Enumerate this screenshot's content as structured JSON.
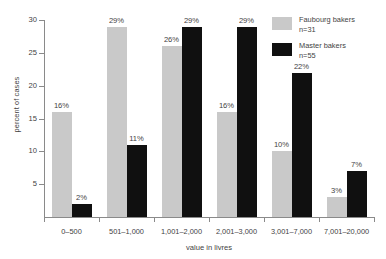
{
  "chart_data": {
    "type": "bar",
    "title": "",
    "xlabel": "value in livres",
    "ylabel": "percent of cases",
    "categories": [
      "0–500",
      "501–1,000",
      "1,001–2,000",
      "2,001–3,000",
      "3,001–7,000",
      "7,001–20,000"
    ],
    "series": [
      {
        "name": "Faubourg bakers",
        "subtitle": "n=31",
        "color": "#c9c9c9",
        "values": [
          16,
          29,
          26,
          16,
          10,
          3
        ],
        "labels": [
          "16%",
          "29%",
          "26%",
          "16%",
          "10%",
          "3%"
        ]
      },
      {
        "name": "Master bakers",
        "subtitle": "n=55",
        "color": "#101010",
        "values": [
          2,
          11,
          29,
          29,
          22,
          7
        ],
        "labels": [
          "2%",
          "11%",
          "29%",
          "29%",
          "22%",
          "7%"
        ]
      }
    ],
    "ylim": [
      0,
      30
    ],
    "yticks": [
      5,
      10,
      15,
      20,
      25,
      30
    ],
    "ytick_labels": [
      "5",
      "10",
      "15",
      "20",
      "25",
      "30"
    ],
    "grid": false,
    "legend_position": "top-right"
  }
}
